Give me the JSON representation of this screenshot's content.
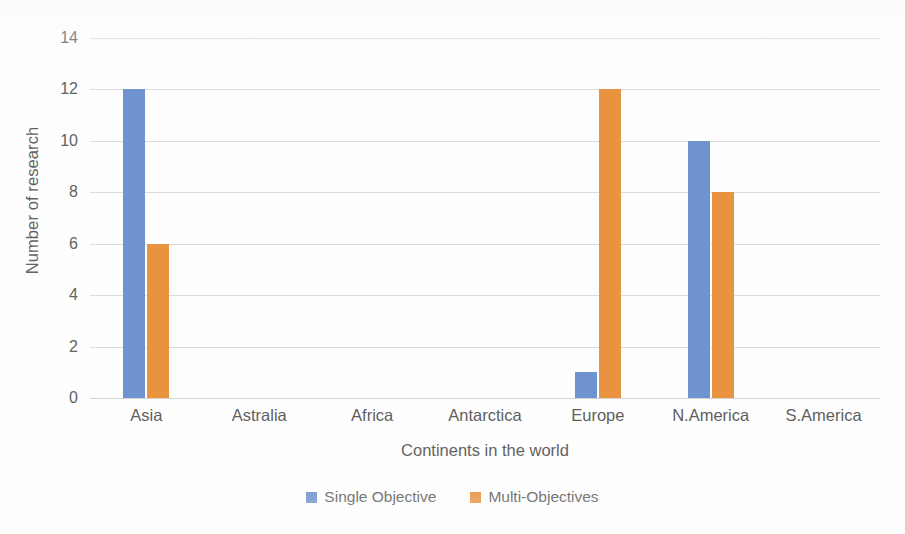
{
  "chart_data": {
    "type": "bar",
    "title": "",
    "xlabel": "Continents in the world",
    "ylabel": "Number of research",
    "categories": [
      "Asia",
      "Astralia",
      "Africa",
      "Antarctica",
      "Europe",
      "N.America",
      "S.America"
    ],
    "series": [
      {
        "name": "Single Objective",
        "color": "#6f93ce",
        "values": [
          12,
          0,
          0,
          0,
          1,
          10,
          0
        ]
      },
      {
        "name": "Multi-Objectives",
        "color": "#e99340",
        "values": [
          6,
          0,
          0,
          0,
          12,
          8,
          0
        ]
      }
    ],
    "ylim": [
      0,
      14
    ],
    "yticks": [
      0,
      2,
      4,
      6,
      8,
      10,
      12,
      14
    ],
    "grid": true,
    "legend_position": "bottom"
  },
  "axes": {
    "y_title": "Number of research",
    "x_title": "Continents in the world"
  },
  "legend": {
    "items": [
      {
        "label": "Single Objective",
        "color": "#6f93ce"
      },
      {
        "label": "Multi-Objectives",
        "color": "#e99340"
      }
    ]
  },
  "colors": {
    "single_objective": "#6f93ce",
    "multi_objectives": "#e99340",
    "gridline": "#dcdcdc",
    "text": "#5f5f5f",
    "background": "#ffffff"
  }
}
